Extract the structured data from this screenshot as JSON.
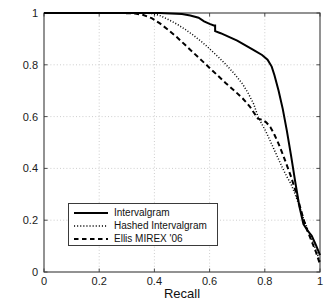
{
  "chart_data": {
    "type": "line",
    "title": "",
    "xlabel": "Recall",
    "ylabel": "Precision",
    "xlim": [
      0,
      1
    ],
    "ylim": [
      0,
      1
    ],
    "xticks": [
      "0",
      "0.2",
      "0.4",
      "0.6",
      "0.8",
      "1"
    ],
    "xtick_values": [
      0,
      0.2,
      0.4,
      0.6,
      0.8,
      1
    ],
    "yticks": [
      "0",
      "0.2",
      "0.4",
      "0.6",
      "0.8",
      "1"
    ],
    "ytick_values": [
      0,
      0.2,
      0.4,
      0.6,
      0.8,
      1
    ],
    "grid": true,
    "grid_style": "dotted",
    "legend_position": "lower-left",
    "series": [
      {
        "name": "Intervalgram",
        "style": "solid",
        "color": "#000000",
        "points": [
          [
            0.0,
            1.0
          ],
          [
            0.1,
            1.0
          ],
          [
            0.2,
            1.0
          ],
          [
            0.3,
            1.0
          ],
          [
            0.38,
            1.0
          ],
          [
            0.42,
            1.0
          ],
          [
            0.46,
            0.998
          ],
          [
            0.5,
            0.996
          ],
          [
            0.53,
            0.99
          ],
          [
            0.56,
            0.982
          ],
          [
            0.58,
            0.968
          ],
          [
            0.6,
            0.958
          ],
          [
            0.615,
            0.952
          ],
          [
            0.62,
            0.952
          ],
          [
            0.62,
            0.93
          ],
          [
            0.64,
            0.922
          ],
          [
            0.67,
            0.908
          ],
          [
            0.7,
            0.893
          ],
          [
            0.73,
            0.875
          ],
          [
            0.76,
            0.857
          ],
          [
            0.79,
            0.838
          ],
          [
            0.81,
            0.82
          ],
          [
            0.825,
            0.793
          ],
          [
            0.835,
            0.76
          ],
          [
            0.85,
            0.7
          ],
          [
            0.865,
            0.63
          ],
          [
            0.88,
            0.545
          ],
          [
            0.895,
            0.45
          ],
          [
            0.91,
            0.35
          ],
          [
            0.925,
            0.255
          ],
          [
            0.94,
            0.185
          ],
          [
            0.955,
            0.16
          ],
          [
            0.97,
            0.14
          ],
          [
            0.985,
            0.105
          ],
          [
            1.0,
            0.065
          ]
        ]
      },
      {
        "name": "Hashed Intervalgram",
        "style": "dotted",
        "color": "#000000",
        "points": [
          [
            0.0,
            1.0
          ],
          [
            0.1,
            1.0
          ],
          [
            0.2,
            1.0
          ],
          [
            0.3,
            1.0
          ],
          [
            0.36,
            1.0
          ],
          [
            0.39,
            0.998
          ],
          [
            0.42,
            0.99
          ],
          [
            0.45,
            0.975
          ],
          [
            0.48,
            0.958
          ],
          [
            0.51,
            0.938
          ],
          [
            0.54,
            0.915
          ],
          [
            0.57,
            0.89
          ],
          [
            0.6,
            0.862
          ],
          [
            0.63,
            0.832
          ],
          [
            0.66,
            0.8
          ],
          [
            0.69,
            0.765
          ],
          [
            0.72,
            0.725
          ],
          [
            0.74,
            0.69
          ],
          [
            0.76,
            0.648
          ],
          [
            0.775,
            0.6
          ],
          [
            0.79,
            0.57
          ],
          [
            0.805,
            0.54
          ],
          [
            0.82,
            0.505
          ],
          [
            0.835,
            0.47
          ],
          [
            0.85,
            0.435
          ],
          [
            0.865,
            0.4
          ],
          [
            0.88,
            0.368
          ],
          [
            0.895,
            0.34
          ],
          [
            0.91,
            0.3
          ],
          [
            0.925,
            0.255
          ],
          [
            0.94,
            0.208
          ],
          [
            0.955,
            0.165
          ],
          [
            0.97,
            0.128
          ],
          [
            0.985,
            0.085
          ],
          [
            1.0,
            0.04
          ]
        ]
      },
      {
        "name": "Ellis MIREX '06",
        "style": "dashed",
        "color": "#000000",
        "points": [
          [
            0.0,
            1.0
          ],
          [
            0.1,
            1.0
          ],
          [
            0.2,
            1.0
          ],
          [
            0.28,
            1.0
          ],
          [
            0.33,
            0.998
          ],
          [
            0.36,
            0.992
          ],
          [
            0.39,
            0.98
          ],
          [
            0.42,
            0.96
          ],
          [
            0.45,
            0.935
          ],
          [
            0.48,
            0.908
          ],
          [
            0.51,
            0.878
          ],
          [
            0.54,
            0.848
          ],
          [
            0.57,
            0.818
          ],
          [
            0.6,
            0.788
          ],
          [
            0.63,
            0.758
          ],
          [
            0.66,
            0.728
          ],
          [
            0.69,
            0.7
          ],
          [
            0.72,
            0.67
          ],
          [
            0.745,
            0.64
          ],
          [
            0.765,
            0.608
          ],
          [
            0.775,
            0.592
          ],
          [
            0.79,
            0.588
          ],
          [
            0.805,
            0.578
          ],
          [
            0.82,
            0.56
          ],
          [
            0.835,
            0.53
          ],
          [
            0.85,
            0.495
          ],
          [
            0.865,
            0.455
          ],
          [
            0.88,
            0.412
          ],
          [
            0.895,
            0.368
          ],
          [
            0.91,
            0.318
          ],
          [
            0.925,
            0.262
          ],
          [
            0.94,
            0.205
          ],
          [
            0.955,
            0.158
          ],
          [
            0.97,
            0.118
          ],
          [
            0.985,
            0.078
          ],
          [
            1.0,
            0.03
          ]
        ]
      }
    ]
  },
  "legend": {
    "entries": [
      {
        "label": "Intervalgram",
        "style": "solid"
      },
      {
        "label": "Hashed Intervalgram",
        "style": "dotted"
      },
      {
        "label": "Ellis MIREX '06",
        "style": "dashed"
      }
    ]
  },
  "axes": {
    "xlabel": "Recall",
    "ylabel": "Precision"
  },
  "colors": {
    "axis": "#3a3a3a",
    "grid": "#b8b8b8",
    "line": "#000000",
    "background": "#ffffff"
  }
}
